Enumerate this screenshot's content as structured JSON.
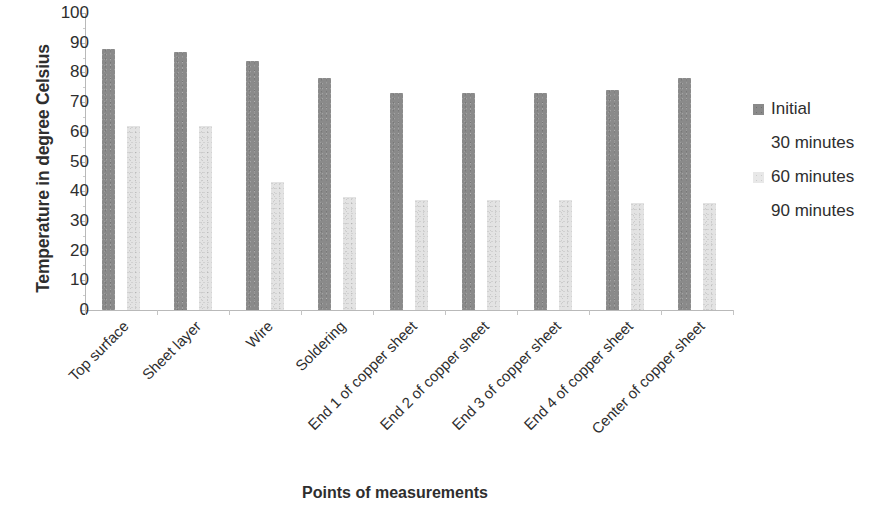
{
  "chart_data": {
    "type": "bar",
    "title": "",
    "xlabel": "Points of measurements",
    "ylabel": "Temperature in degree Celsius",
    "ylim": [
      0,
      100
    ],
    "ytick_labels": [
      "100",
      "90",
      "80",
      "70",
      "60",
      "50",
      "40",
      "30",
      "20",
      "10",
      "0"
    ],
    "ytick_values": [
      100,
      90,
      80,
      70,
      60,
      50,
      40,
      30,
      20,
      10,
      0
    ],
    "grid": false,
    "legend_position": "right",
    "categories": [
      "Top surface",
      "Sheet layer",
      "Wire",
      "Soldering",
      "End 1 of copper sheet",
      "End 2 of copper sheet",
      "End 3 of copper sheet",
      "End 4 of copper sheet",
      "Center of copper sheet"
    ],
    "series": [
      {
        "name": "Initial",
        "color": "#8a8a8a",
        "values": [
          88,
          87,
          84,
          78,
          73,
          73,
          73,
          74,
          78
        ]
      },
      {
        "name": "30 minutes",
        "color": "#ffffff",
        "values": [
          null,
          null,
          null,
          null,
          null,
          null,
          null,
          null,
          null
        ]
      },
      {
        "name": "60 minutes",
        "color": "#e3e3e3",
        "values": [
          62,
          62,
          43,
          38,
          37,
          37,
          37,
          36,
          36
        ]
      },
      {
        "name": "90 minutes",
        "color": "#ffffff",
        "values": [
          null,
          null,
          null,
          null,
          null,
          null,
          null,
          null,
          null
        ]
      }
    ],
    "legend_entries": [
      {
        "label": "Initial",
        "swatch": "visible"
      },
      {
        "label": "30 minutes",
        "swatch": "hidden"
      },
      {
        "label": "60 minutes",
        "swatch": "visible"
      },
      {
        "label": "90 minutes",
        "swatch": "hidden"
      }
    ]
  }
}
